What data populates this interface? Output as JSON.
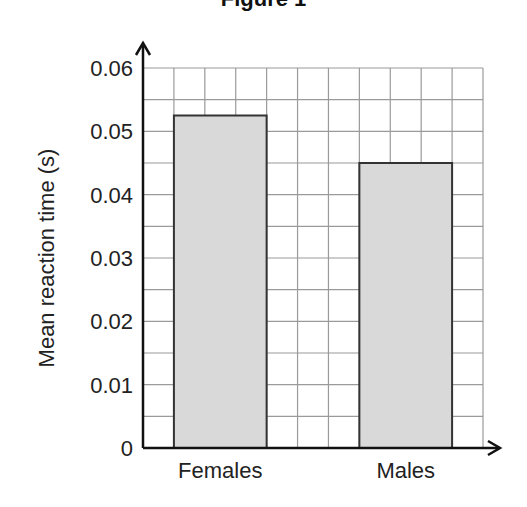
{
  "figure": {
    "title": "Figure 1"
  },
  "chart_data": {
    "type": "bar",
    "title": "Figure 1",
    "categories": [
      "Females",
      "Males"
    ],
    "values": [
      0.0525,
      0.045
    ],
    "xlabel": "",
    "ylabel": "Mean reaction time (s)",
    "ylim": [
      0,
      0.06
    ],
    "yticks": [
      0,
      0.01,
      0.02,
      0.03,
      0.04,
      0.05,
      0.06
    ],
    "ytick_labels": [
      "0",
      "0.01",
      "0.02",
      "0.03",
      "0.04",
      "0.05",
      "0.06"
    ],
    "minor_grid_step": 0.005,
    "grid": true,
    "legend": null,
    "bar_color": "#d9d9d9",
    "bar_edge_color": "#333333",
    "grid_color": "#9a9a9a"
  }
}
